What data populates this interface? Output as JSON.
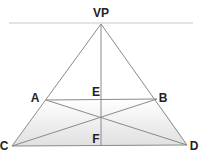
{
  "diagram": {
    "colors": {
      "line": "#8a8a8a",
      "horizon": "#c8c8c8",
      "fill_top": "#ffffff",
      "fill_bottom": "#e2e2e2",
      "label": "#222222"
    },
    "labels": {
      "vp": "VP",
      "a": "A",
      "b": "B",
      "c": "C",
      "d": "D",
      "e": "E",
      "f": "F"
    },
    "points": {
      "VP": [
        101,
        24
      ],
      "A": [
        46,
        100
      ],
      "B": [
        157,
        99
      ],
      "C": [
        12,
        146
      ],
      "D": [
        187,
        145
      ],
      "E": [
        101,
        99
      ],
      "F": [
        101,
        146
      ],
      "X": [
        101,
        117
      ]
    },
    "horizon_y": 23
  }
}
